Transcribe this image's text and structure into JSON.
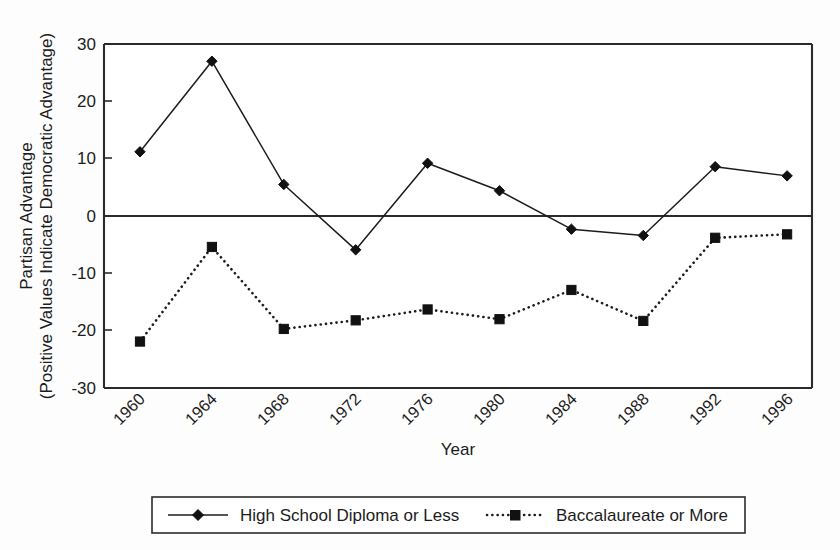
{
  "chart_data": {
    "type": "line",
    "title": "",
    "xlabel": "Year",
    "ylabel": "Partisan Advantage\n(Positive Values Indicate Democratic Advantage)",
    "ylabel_line1": "Partisan Advantage",
    "ylabel_line2": "(Positive Values Indicate Democratic Advantage)",
    "categories": [
      "1960",
      "1964",
      "1968",
      "1972",
      "1976",
      "1980",
      "1984",
      "1988",
      "1992",
      "1996"
    ],
    "x": [
      1960,
      1964,
      1968,
      1972,
      1976,
      1980,
      1984,
      1988,
      1992,
      1996
    ],
    "ylim": [
      -30,
      30
    ],
    "yticks": [
      30,
      20,
      10,
      0,
      -10,
      -20,
      -30
    ],
    "ytick_labels": [
      "30",
      "20",
      "10",
      "0",
      "-10",
      "-20",
      "-30"
    ],
    "grid": false,
    "zero_line": true,
    "legend_position": "bottom",
    "series": [
      {
        "name": "High School Diploma or Less",
        "marker": "diamond",
        "linestyle": "solid",
        "color": "#1c1c1c",
        "values": [
          11.2,
          27.0,
          5.5,
          -5.9,
          9.2,
          4.4,
          -2.3,
          -3.4,
          8.6,
          7.0
        ]
      },
      {
        "name": "Baccalaureate or More",
        "marker": "square",
        "linestyle": "dotted",
        "color": "#1c1c1c",
        "values": [
          -21.9,
          -5.4,
          -19.7,
          -18.2,
          -16.3,
          -18.0,
          -12.9,
          -18.3,
          -3.8,
          -3.2
        ]
      }
    ]
  },
  "legend": {
    "entries": [
      {
        "label": "High School Diploma or Less"
      },
      {
        "label": "Baccalaureate or More"
      }
    ]
  }
}
